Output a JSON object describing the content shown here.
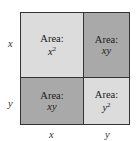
{
  "diagram": {
    "cells": [
      {
        "id": "top-left",
        "label": "Area:",
        "math": "x",
        "exp": "2",
        "color": "#dcdcdc"
      },
      {
        "id": "top-right",
        "label": "Area:",
        "math": "xy",
        "exp": "",
        "color": "#a9a9a9"
      },
      {
        "id": "bottom-left",
        "label": "Area:",
        "math": "xy",
        "exp": "",
        "color": "#a9a9a9"
      },
      {
        "id": "bottom-right",
        "label": "Area:",
        "math": "y",
        "exp": "2",
        "color": "#dcdcdc"
      }
    ],
    "left_labels": [
      "x",
      "y"
    ],
    "bottom_labels": [
      "x",
      "y"
    ]
  }
}
